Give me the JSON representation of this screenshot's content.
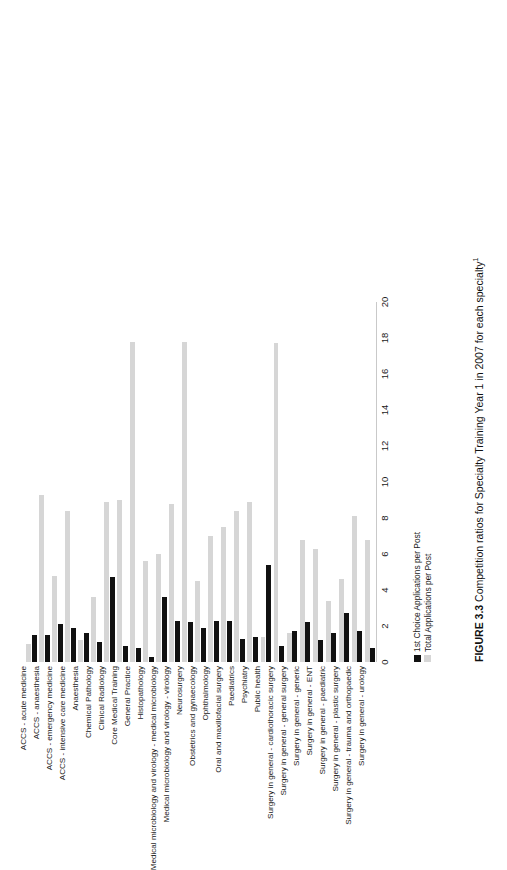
{
  "figure": {
    "caption_label": "FIGURE 3.3",
    "caption_text": "Competition ratios for Specialty Training Year 1 in 2007 for each specialty",
    "caption_footnote": "1"
  },
  "legend": {
    "items": [
      {
        "key": "first-choice",
        "label": "1st Choice Applications per Post",
        "color": "#111111"
      },
      {
        "key": "total",
        "label": "Total Applications per Post",
        "color": "#d6d6d6"
      }
    ]
  },
  "chart_data": {
    "type": "bar",
    "title": "Competition ratios for Specialty Training Year 1 in 2007 for each specialty",
    "orientation": "vertical",
    "xlabel": "",
    "ylabel": "",
    "ylim": [
      0,
      20
    ],
    "ticks": [
      0,
      2,
      4,
      6,
      8,
      10,
      12,
      14,
      16,
      18,
      20
    ],
    "grid": false,
    "legend_position": "below-axis-left",
    "categories": [
      "Surgery in general - urology",
      "Surgery in general - trauma and orthopaedic",
      "Surgery in general - plastic surgery",
      "Surgery in general - paediatric",
      "Surgery in general - ENT",
      "Surgery in general - generic",
      "Surgery in general - general surgery",
      "Surgery in general - cardiothoracic surgery",
      "Public health",
      "Psychiatry",
      "Paediatrics",
      "Oral and maxillofacial surgery",
      "Ophthalmology",
      "Obstetrics and gynaecology",
      "Neurosurgery",
      "Medical microbiology and virology - virology",
      "Medical microbiology and virology - medical microbiology",
      "Histopathology",
      "General Practice",
      "Core Medical Training",
      "Clinical Radiology",
      "Chemical Pathology",
      "Anaesthesia",
      "ACCS - intensive care medicine",
      "ACCS - emergency medicine",
      "ACCS - anaesthesia",
      "ACCS - acute medicine"
    ],
    "series": [
      {
        "name": "1st Choice Applications per Post",
        "color": "#111111",
        "values": [
          0.8,
          1.7,
          2.7,
          1.6,
          1.2,
          2.2,
          1.7,
          0.9,
          5.4,
          1.4,
          1.3,
          2.3,
          2.3,
          1.9,
          2.2,
          2.3,
          3.6,
          0.3,
          0.8,
          0.9,
          4.7,
          1.1,
          1.6,
          1.9,
          2.1,
          1.5,
          1.5
        ]
      },
      {
        "name": "Total Applications per Post",
        "color": "#d6d6d6",
        "values": [
          6.8,
          8.1,
          4.6,
          3.4,
          6.3,
          6.8,
          1.6,
          17.7,
          1.4,
          8.9,
          8.4,
          7.5,
          7.0,
          4.5,
          17.8,
          8.8,
          6.0,
          5.6,
          17.8,
          9.0,
          8.9,
          3.6,
          1.2,
          8.4,
          4.8,
          9.3,
          1.0
        ]
      }
    ]
  }
}
